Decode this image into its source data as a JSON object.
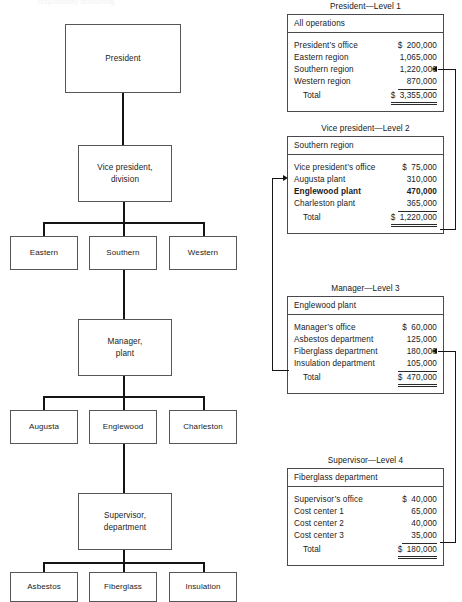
{
  "figure": {
    "top_cut_caption": "responsibility accounting"
  },
  "org_chart": {
    "levels": [
      {
        "name": "president",
        "boxes": [
          {
            "label": "President"
          }
        ]
      },
      {
        "name": "vice-president",
        "boxes": [
          {
            "label": "Vice president,\ndivision"
          }
        ]
      },
      {
        "name": "regions",
        "boxes": [
          {
            "label": "Eastern"
          },
          {
            "label": "Southern"
          },
          {
            "label": "Western"
          }
        ]
      },
      {
        "name": "manager",
        "boxes": [
          {
            "label": "Manager,\nplant"
          }
        ]
      },
      {
        "name": "plants",
        "boxes": [
          {
            "label": "Augusta"
          },
          {
            "label": "Englewood"
          },
          {
            "label": "Charleston"
          }
        ]
      },
      {
        "name": "supervisor",
        "boxes": [
          {
            "label": "Supervisor,\ndepartment"
          }
        ]
      },
      {
        "name": "departments",
        "boxes": [
          {
            "label": "Asbestos"
          },
          {
            "label": "Fiberglass"
          },
          {
            "label": "Insulation"
          }
        ]
      }
    ],
    "box_labels": {
      "president": "President",
      "vice_president_l1": "Vice president,",
      "vice_president_l2": "division",
      "eastern": "Eastern",
      "southern": "Southern",
      "western": "Western",
      "manager_l1": "Manager,",
      "manager_l2": "plant",
      "augusta": "Augusta",
      "englewood": "Englewood",
      "charleston": "Charleston",
      "supervisor_l1": "Supervisor,",
      "supervisor_l2": "department",
      "asbestos": "Asbestos",
      "fiberglass": "Fiberglass",
      "insulation": "Insulation"
    }
  },
  "reports": [
    {
      "id": "level-1",
      "title": "President—Level 1",
      "header": "All operations",
      "rows": [
        {
          "name": "President’s office",
          "currency": "$",
          "amount": "200,000",
          "bold": false,
          "ruled": false,
          "total": false
        },
        {
          "name": "Eastern region",
          "currency": "",
          "amount": "1,065,000",
          "bold": false,
          "ruled": false,
          "total": false
        },
        {
          "name": "Southern region",
          "currency": "",
          "amount": "1,220,000",
          "bold": false,
          "ruled": false,
          "total": false
        },
        {
          "name": "Western region",
          "currency": "",
          "amount": "870,000",
          "bold": false,
          "ruled": true,
          "total": false
        },
        {
          "name": "Total",
          "currency": "$",
          "amount": "3,355,000",
          "bold": false,
          "ruled": false,
          "total": true
        }
      ]
    },
    {
      "id": "level-2",
      "title": "Vice president—Level 2",
      "header": "Southern region",
      "rows": [
        {
          "name": "Vice president’s office",
          "currency": "$",
          "amount": "75,000",
          "bold": false,
          "ruled": false,
          "total": false
        },
        {
          "name": "Augusta plant",
          "currency": "",
          "amount": "310,000",
          "bold": false,
          "ruled": false,
          "total": false
        },
        {
          "name": "Englewood plant",
          "currency": "",
          "amount": "470,000",
          "bold": true,
          "ruled": false,
          "total": false
        },
        {
          "name": "Charleston plant",
          "currency": "",
          "amount": "365,000",
          "bold": false,
          "ruled": true,
          "total": false
        },
        {
          "name": "Total",
          "currency": "$",
          "amount": "1,220,000",
          "bold": false,
          "ruled": false,
          "total": true
        }
      ]
    },
    {
      "id": "level-3",
      "title": "Manager—Level 3",
      "header": "Englewood plant",
      "rows": [
        {
          "name": "Manager’s office",
          "currency": "$",
          "amount": "60,000",
          "bold": false,
          "ruled": false,
          "total": false
        },
        {
          "name": "Asbestos department",
          "currency": "",
          "amount": "125,000",
          "bold": false,
          "ruled": false,
          "total": false
        },
        {
          "name": "Fiberglass department",
          "currency": "",
          "amount": "180,000",
          "bold": false,
          "ruled": false,
          "total": false
        },
        {
          "name": "Insulation department",
          "currency": "",
          "amount": "105,000",
          "bold": false,
          "ruled": true,
          "total": false
        },
        {
          "name": "Total",
          "currency": "$",
          "amount": "470,000",
          "bold": false,
          "ruled": false,
          "total": true
        }
      ]
    },
    {
      "id": "level-4",
      "title": "Supervisor—Level 4",
      "header": "Fiberglass department",
      "rows": [
        {
          "name": "Supervisor’s office",
          "currency": "$",
          "amount": "40,000",
          "bold": false,
          "ruled": false,
          "total": false
        },
        {
          "name": "Cost center 1",
          "currency": "",
          "amount": "65,000",
          "bold": false,
          "ruled": false,
          "total": false
        },
        {
          "name": "Cost center 2",
          "currency": "",
          "amount": "40,000",
          "bold": false,
          "ruled": false,
          "total": false
        },
        {
          "name": "Cost center 3",
          "currency": "",
          "amount": "35,000",
          "bold": false,
          "ruled": true,
          "total": false
        },
        {
          "name": "Total",
          "currency": "$",
          "amount": "180,000",
          "bold": false,
          "ruled": false,
          "total": true
        }
      ]
    }
  ],
  "colors": {
    "line": "#141414",
    "box_border": "#55555a",
    "background": "#ffffff"
  }
}
